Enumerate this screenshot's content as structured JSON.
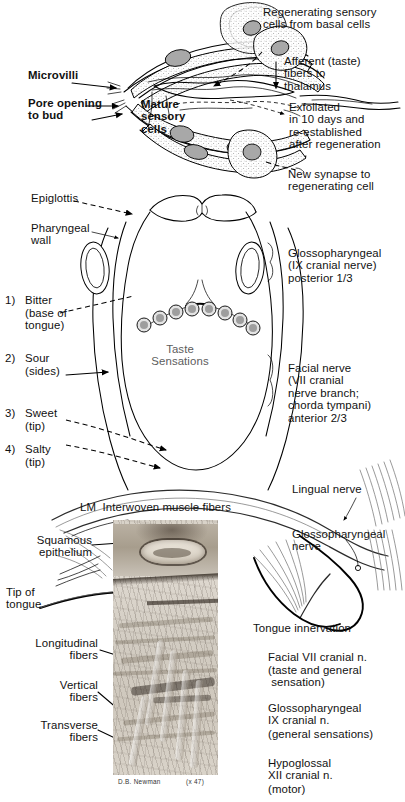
{
  "figure": {
    "panels": [
      "taste-bud-detail",
      "tongue-dorsum-map",
      "light-micrograph",
      "tongue-innervation"
    ]
  },
  "taste_bud": {
    "labels": {
      "regenerating": "Regenerating sensory\ncells from basal cells",
      "afferent": "Afferent (taste)\nfibers to\nthalamus",
      "microvilli": "Microvilli",
      "pore": "Pore opening\nto bud",
      "mature": "Mature\nsensory\ncells",
      "exfoliated": "Exfoliated\nin 10 days and\nre-established\nafter regeneration",
      "new_synapse": "New synapse to\nregenerating cell"
    }
  },
  "tongue_map": {
    "labels": {
      "epiglottis": "Epiglottis",
      "pharyngeal_wall": "Pharyngeal\nwall",
      "taste_sensations": "Taste\nSensations",
      "glossopharyngeal": "Glossopharyngeal\n(IX cranial nerve)\nposterior 1/3",
      "facial": "Facial nerve\n(VII cranial\nnerve branch;\nchorda tympani)\nanterior 2/3"
    },
    "taste_regions": [
      {
        "number": "1)",
        "name": "Bitter",
        "location": "(base of\ntongue)"
      },
      {
        "number": "2)",
        "name": "Sour",
        "location": "(sides)"
      },
      {
        "number": "3)",
        "name": "Sweet",
        "location": "(tip)"
      },
      {
        "number": "4)",
        "name": "Salty",
        "location": "(tip)"
      }
    ]
  },
  "micrograph": {
    "header": "LM  Interwoven muscle fibers",
    "credit": "D.B. Newman",
    "magnification": "(x 47)",
    "labels": {
      "squamous": "Squamous\nepithelium",
      "tip_of_tongue": "Tip of\ntongue",
      "longitudinal": "Longitudinal\nfibers",
      "vertical": "Vertical\nfibers",
      "transverse": "Transverse\nfibers"
    }
  },
  "innervation": {
    "title": "Tongue innervation",
    "labels": {
      "lingual_nerve": "Lingual nerve",
      "glossopharyngeal_nerve": "Glossopharyngeal\nnerve"
    },
    "nerves": [
      {
        "name": "Facial VII cranial n.",
        "function": "(taste and general\n sensation)"
      },
      {
        "name": "Glossopharyngeal\nIX cranial n.",
        "function": "(general sensations)"
      },
      {
        "name": "Hypoglossal\nXII cranial n.",
        "function": "(motor)"
      }
    ]
  },
  "colors": {
    "ink": "#111111",
    "stipple": "#cfcfcf",
    "nucleus": "#a8a8a8",
    "grey_text": "#5c5c5c",
    "paper": "#ffffff"
  }
}
